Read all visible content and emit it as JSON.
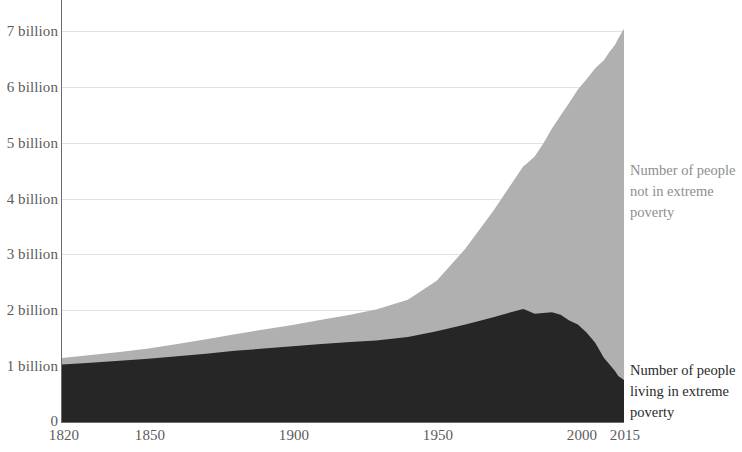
{
  "chart_data": {
    "type": "area",
    "title": "",
    "subtitle": "",
    "xlabel": "",
    "ylabel": "",
    "stacked": true,
    "grid": true,
    "legend_position": "right-inline",
    "xlim": [
      1820,
      2015
    ],
    "ylim": [
      0,
      7350000000
    ],
    "y_tick_labels": [
      "0",
      "1 billion",
      "2 billion",
      "3 billion",
      "4 billion",
      "5 billion",
      "6 billion",
      "7 billion"
    ],
    "y_tick_values": [
      0,
      1000000000,
      2000000000,
      3000000000,
      4000000000,
      5000000000,
      6000000000,
      7000000000
    ],
    "x_tick_labels": [
      "1820",
      "1850",
      "1900",
      "1950",
      "2000",
      "2015"
    ],
    "x_tick_values": [
      1820,
      1850,
      1900,
      1950,
      2000,
      2015
    ],
    "x": [
      1820,
      1830,
      1840,
      1850,
      1860,
      1870,
      1880,
      1890,
      1900,
      1910,
      1920,
      1929,
      1940,
      1950,
      1960,
      1970,
      1980,
      1981,
      1984,
      1987,
      1990,
      1993,
      1996,
      1999,
      2002,
      2005,
      2008,
      2010,
      2011,
      2012,
      2013,
      2015
    ],
    "series": [
      {
        "name": "Number of people living in extreme poverty",
        "color": "#262626",
        "values": [
          1000000000,
          1030000000,
          1065000000,
          1100000000,
          1145000000,
          1190000000,
          1240000000,
          1280000000,
          1320000000,
          1360000000,
          1395000000,
          1420000000,
          1480000000,
          1580000000,
          1700000000,
          1830000000,
          1970000000,
          1950000000,
          1885000000,
          1900000000,
          1910000000,
          1870000000,
          1770000000,
          1700000000,
          1560000000,
          1380000000,
          1120000000,
          1000000000,
          940000000,
          880000000,
          800000000,
          730000000
        ]
      },
      {
        "name": "Number of people not in extreme poverty",
        "color": "#b0b0b0",
        "values": [
          115000000,
          135000000,
          155000000,
          180000000,
          215000000,
          250000000,
          290000000,
          330000000,
          370000000,
          420000000,
          475000000,
          540000000,
          650000000,
          880000000,
          1320000000,
          1870000000,
          2480000000,
          2540000000,
          2740000000,
          2950000000,
          3200000000,
          3470000000,
          3790000000,
          4090000000,
          4410000000,
          4780000000,
          5180000000,
          5450000000,
          5570000000,
          5700000000,
          5880000000,
          6120000000
        ]
      }
    ],
    "total_top_note": "Total population reaches about 7.3 billion in 2015"
  },
  "annotations": {
    "upper_series_label": "Number of people not in extreme poverty",
    "lower_series_label": "Number of people living in extreme poverty"
  },
  "colors": {
    "extreme_poverty": "#262626",
    "not_extreme_poverty": "#b0b0b0",
    "axis": "#6b6b6b",
    "gridline": "#e3e3e3",
    "tick_text": "#5c5c5c",
    "background": "#ffffff"
  }
}
